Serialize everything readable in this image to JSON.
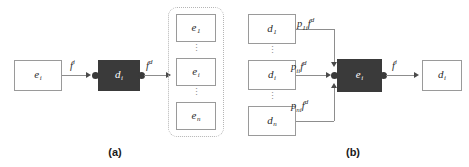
{
  "figure": {
    "panels": [
      {
        "id": "a",
        "caption": "(a)",
        "source_node": {
          "base": "e",
          "sub": "i"
        },
        "process_node": {
          "base": "d",
          "sub": "i"
        },
        "in_flow_label": {
          "base": "f",
          "sup": "i"
        },
        "out_flow_label": {
          "base": "f",
          "sup": "d"
        },
        "target_group": {
          "items": [
            {
              "base": "e",
              "sub": "1"
            },
            {
              "base": "e",
              "sub": "i"
            },
            {
              "base": "e",
              "sub": "n"
            }
          ],
          "ellipsis": "⋮"
        }
      },
      {
        "id": "b",
        "caption": "(b)",
        "source_nodes": [
          {
            "base": "d",
            "sub": "1"
          },
          {
            "base": "d",
            "sub": "i"
          },
          {
            "base": "d",
            "sub": "n"
          }
        ],
        "ellipsis": "⋮",
        "edge_labels": [
          {
            "base": "p",
            "sub": "1i",
            "flow_base": "f",
            "flow_sup": "d"
          },
          {
            "base": "p",
            "sub": "ii",
            "flow_base": "f",
            "flow_sup": "d"
          },
          {
            "base": "p",
            "sub": "ni",
            "flow_base": "f",
            "flow_sup": "d"
          }
        ],
        "process_node": {
          "base": "e",
          "sub": "i"
        },
        "out_flow_label": {
          "base": "f",
          "sup": "i"
        },
        "target_node": {
          "base": "d",
          "sub": "i"
        }
      }
    ],
    "colors": {
      "process_fill": "#3a3a3a",
      "box_stroke": "#9a9a9a",
      "line": "#8d8d8d",
      "group_stroke": "#b5b5b5",
      "text": "#2b2b2b"
    }
  }
}
